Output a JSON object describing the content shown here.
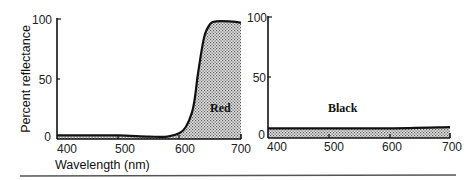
{
  "chart_data": [
    {
      "type": "area",
      "title": "",
      "series_label": "Red",
      "xlabel": "Wavelength (nm)",
      "ylabel": "Percent reflectance",
      "xlim": [
        400,
        700
      ],
      "ylim": [
        0,
        100
      ],
      "x_ticks": [
        "400",
        "500",
        "600",
        "700"
      ],
      "y_ticks": [
        "0",
        "50",
        "100"
      ],
      "grid": false,
      "x": [
        400,
        450,
        500,
        550,
        580,
        600,
        610,
        620,
        625,
        630,
        640,
        650,
        660,
        680,
        700
      ],
      "values": [
        3,
        3,
        3,
        2,
        2,
        5,
        10,
        22,
        35,
        55,
        85,
        96,
        98,
        98,
        97
      ]
    },
    {
      "type": "area",
      "title": "",
      "series_label": "Black",
      "xlabel": "",
      "ylabel": "",
      "xlim": [
        400,
        700
      ],
      "ylim": [
        0,
        100
      ],
      "x_ticks": [
        "400",
        "500",
        "600",
        "700"
      ],
      "y_ticks": [
        "0",
        "50",
        "100"
      ],
      "grid": false,
      "x": [
        400,
        500,
        600,
        700
      ],
      "values": [
        8,
        8,
        8,
        9
      ]
    }
  ],
  "colors": {
    "line": "#111111",
    "fill_dot": "#555555",
    "fill_bg": "#e6e6e6"
  }
}
